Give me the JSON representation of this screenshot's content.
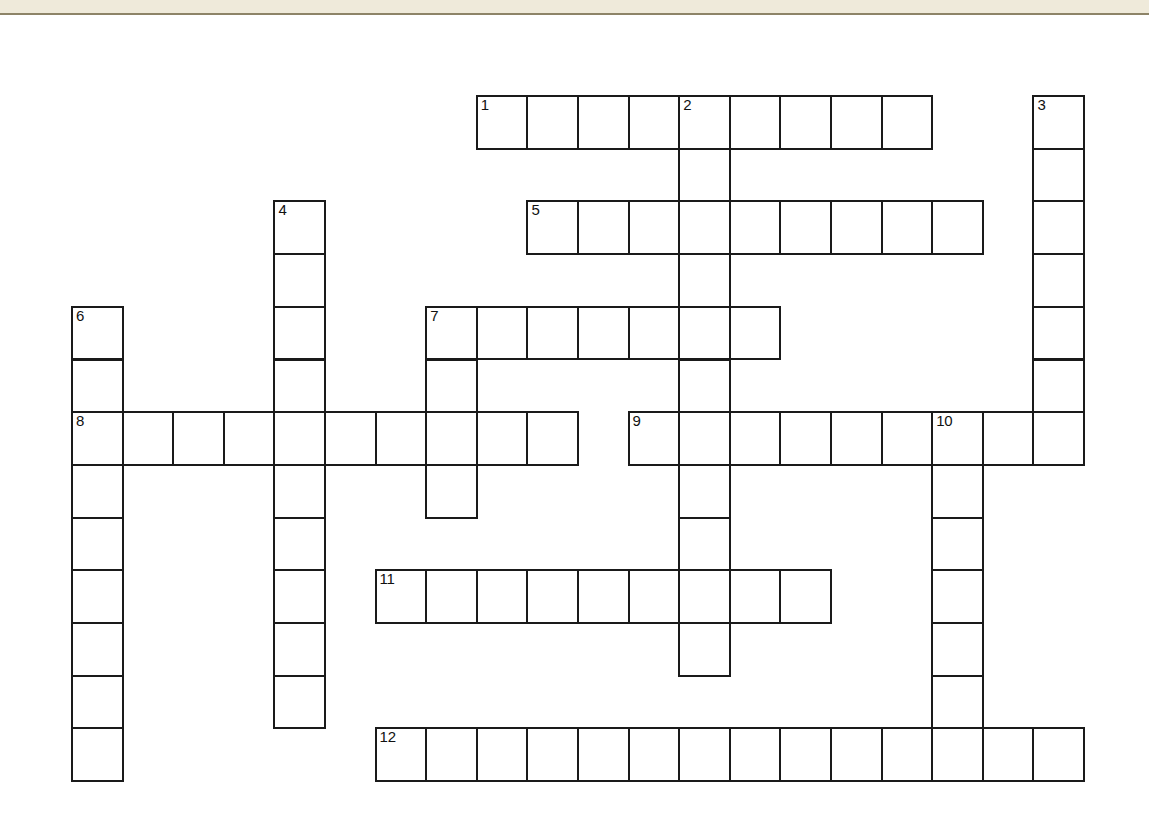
{
  "page": {
    "type": "crossword-puzzle",
    "background_color": "#ffffff",
    "grid_line_color": "#1a1a1a",
    "cell_fill_color": "#ffffff",
    "number_color": "#111111"
  },
  "top_band": {
    "band_color": "#efeada",
    "rule_color": "#8d8468"
  },
  "grid": {
    "origin_x": 71,
    "origin_y": 95,
    "cell_width": 50.6,
    "cell_height": 52.7,
    "columns": 21,
    "rows": 14
  },
  "entries": [
    {
      "number": "1",
      "direction": "across",
      "row": 0,
      "col": 8,
      "length": 9
    },
    {
      "number": "2",
      "direction": "down",
      "row": 0,
      "col": 12,
      "length": 11
    },
    {
      "number": "3",
      "direction": "down",
      "row": 0,
      "col": 19,
      "length": 7
    },
    {
      "number": "4",
      "direction": "down",
      "row": 2,
      "col": 4,
      "length": 10
    },
    {
      "number": "5",
      "direction": "across",
      "row": 2,
      "col": 9,
      "length": 9
    },
    {
      "number": "6",
      "direction": "down",
      "row": 4,
      "col": 0,
      "length": 9
    },
    {
      "number": "7",
      "direction": "across",
      "row": 4,
      "col": 7,
      "length": 7
    },
    {
      "number": "7",
      "direction": "down",
      "row": 4,
      "col": 7,
      "length": 5
    },
    {
      "number": "8",
      "direction": "across",
      "row": 6,
      "col": 0,
      "length": 10
    },
    {
      "number": "9",
      "direction": "across",
      "row": 6,
      "col": 11,
      "length": 9
    },
    {
      "number": "10",
      "direction": "down",
      "row": 6,
      "col": 17,
      "length": 7
    },
    {
      "number": "11",
      "direction": "across",
      "row": 9,
      "col": 6,
      "length": 9
    },
    {
      "number": "12",
      "direction": "across",
      "row": 12,
      "col": 6,
      "length": 14
    }
  ],
  "cells": [
    {
      "row": 0,
      "col": 8,
      "number": "1"
    },
    {
      "row": 0,
      "col": 9,
      "number": ""
    },
    {
      "row": 0,
      "col": 10,
      "number": ""
    },
    {
      "row": 0,
      "col": 11,
      "number": ""
    },
    {
      "row": 0,
      "col": 12,
      "number": "2"
    },
    {
      "row": 0,
      "col": 13,
      "number": ""
    },
    {
      "row": 0,
      "col": 14,
      "number": ""
    },
    {
      "row": 0,
      "col": 15,
      "number": ""
    },
    {
      "row": 0,
      "col": 16,
      "number": ""
    },
    {
      "row": 0,
      "col": 19,
      "number": "3"
    },
    {
      "row": 1,
      "col": 12,
      "number": ""
    },
    {
      "row": 1,
      "col": 19,
      "number": ""
    },
    {
      "row": 2,
      "col": 4,
      "number": "4"
    },
    {
      "row": 2,
      "col": 9,
      "number": "5"
    },
    {
      "row": 2,
      "col": 10,
      "number": ""
    },
    {
      "row": 2,
      "col": 11,
      "number": ""
    },
    {
      "row": 2,
      "col": 12,
      "number": ""
    },
    {
      "row": 2,
      "col": 13,
      "number": ""
    },
    {
      "row": 2,
      "col": 14,
      "number": ""
    },
    {
      "row": 2,
      "col": 15,
      "number": ""
    },
    {
      "row": 2,
      "col": 16,
      "number": ""
    },
    {
      "row": 2,
      "col": 17,
      "number": ""
    },
    {
      "row": 2,
      "col": 19,
      "number": ""
    },
    {
      "row": 3,
      "col": 4,
      "number": ""
    },
    {
      "row": 3,
      "col": 12,
      "number": ""
    },
    {
      "row": 3,
      "col": 19,
      "number": ""
    },
    {
      "row": 4,
      "col": 0,
      "number": "6"
    },
    {
      "row": 4,
      "col": 4,
      "number": ""
    },
    {
      "row": 4,
      "col": 7,
      "number": "7"
    },
    {
      "row": 4,
      "col": 8,
      "number": ""
    },
    {
      "row": 4,
      "col": 9,
      "number": ""
    },
    {
      "row": 4,
      "col": 10,
      "number": ""
    },
    {
      "row": 4,
      "col": 11,
      "number": ""
    },
    {
      "row": 4,
      "col": 12,
      "number": ""
    },
    {
      "row": 4,
      "col": 13,
      "number": ""
    },
    {
      "row": 4,
      "col": 19,
      "number": ""
    },
    {
      "row": 5,
      "col": 0,
      "number": ""
    },
    {
      "row": 5,
      "col": 4,
      "number": ""
    },
    {
      "row": 5,
      "col": 7,
      "number": ""
    },
    {
      "row": 5,
      "col": 12,
      "number": ""
    },
    {
      "row": 5,
      "col": 19,
      "number": ""
    },
    {
      "row": 6,
      "col": 0,
      "number": "8"
    },
    {
      "row": 6,
      "col": 1,
      "number": ""
    },
    {
      "row": 6,
      "col": 2,
      "number": ""
    },
    {
      "row": 6,
      "col": 3,
      "number": ""
    },
    {
      "row": 6,
      "col": 4,
      "number": ""
    },
    {
      "row": 6,
      "col": 5,
      "number": ""
    },
    {
      "row": 6,
      "col": 6,
      "number": ""
    },
    {
      "row": 6,
      "col": 7,
      "number": ""
    },
    {
      "row": 6,
      "col": 8,
      "number": ""
    },
    {
      "row": 6,
      "col": 9,
      "number": ""
    },
    {
      "row": 6,
      "col": 11,
      "number": "9"
    },
    {
      "row": 6,
      "col": 12,
      "number": ""
    },
    {
      "row": 6,
      "col": 13,
      "number": ""
    },
    {
      "row": 6,
      "col": 14,
      "number": ""
    },
    {
      "row": 6,
      "col": 15,
      "number": ""
    },
    {
      "row": 6,
      "col": 16,
      "number": ""
    },
    {
      "row": 6,
      "col": 17,
      "number": "10"
    },
    {
      "row": 6,
      "col": 18,
      "number": ""
    },
    {
      "row": 6,
      "col": 19,
      "number": ""
    },
    {
      "row": 7,
      "col": 0,
      "number": ""
    },
    {
      "row": 7,
      "col": 4,
      "number": ""
    },
    {
      "row": 7,
      "col": 7,
      "number": ""
    },
    {
      "row": 7,
      "col": 12,
      "number": ""
    },
    {
      "row": 7,
      "col": 17,
      "number": ""
    },
    {
      "row": 8,
      "col": 0,
      "number": ""
    },
    {
      "row": 8,
      "col": 4,
      "number": ""
    },
    {
      "row": 8,
      "col": 12,
      "number": ""
    },
    {
      "row": 8,
      "col": 17,
      "number": ""
    },
    {
      "row": 9,
      "col": 0,
      "number": ""
    },
    {
      "row": 9,
      "col": 4,
      "number": ""
    },
    {
      "row": 9,
      "col": 6,
      "number": "11"
    },
    {
      "row": 9,
      "col": 7,
      "number": ""
    },
    {
      "row": 9,
      "col": 8,
      "number": ""
    },
    {
      "row": 9,
      "col": 9,
      "number": ""
    },
    {
      "row": 9,
      "col": 10,
      "number": ""
    },
    {
      "row": 9,
      "col": 11,
      "number": ""
    },
    {
      "row": 9,
      "col": 12,
      "number": ""
    },
    {
      "row": 9,
      "col": 13,
      "number": ""
    },
    {
      "row": 9,
      "col": 14,
      "number": ""
    },
    {
      "row": 9,
      "col": 17,
      "number": ""
    },
    {
      "row": 10,
      "col": 0,
      "number": ""
    },
    {
      "row": 10,
      "col": 4,
      "number": ""
    },
    {
      "row": 10,
      "col": 12,
      "number": ""
    },
    {
      "row": 10,
      "col": 17,
      "number": ""
    },
    {
      "row": 11,
      "col": 0,
      "number": ""
    },
    {
      "row": 11,
      "col": 4,
      "number": ""
    },
    {
      "row": 11,
      "col": 17,
      "number": ""
    },
    {
      "row": 12,
      "col": 0,
      "number": ""
    },
    {
      "row": 12,
      "col": 6,
      "number": "12"
    },
    {
      "row": 12,
      "col": 7,
      "number": ""
    },
    {
      "row": 12,
      "col": 8,
      "number": ""
    },
    {
      "row": 12,
      "col": 9,
      "number": ""
    },
    {
      "row": 12,
      "col": 10,
      "number": ""
    },
    {
      "row": 12,
      "col": 11,
      "number": ""
    },
    {
      "row": 12,
      "col": 12,
      "number": ""
    },
    {
      "row": 12,
      "col": 13,
      "number": ""
    },
    {
      "row": 12,
      "col": 14,
      "number": ""
    },
    {
      "row": 12,
      "col": 15,
      "number": ""
    },
    {
      "row": 12,
      "col": 16,
      "number": ""
    },
    {
      "row": 12,
      "col": 17,
      "number": ""
    },
    {
      "row": 12,
      "col": 18,
      "number": ""
    },
    {
      "row": 12,
      "col": 19,
      "number": ""
    }
  ]
}
